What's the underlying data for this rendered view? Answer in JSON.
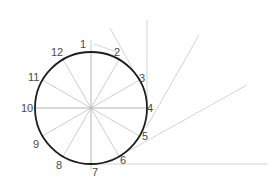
{
  "diagram": {
    "colors": {
      "circle": "#1e1e1e",
      "spokes": "#c8c8c8",
      "construction": "#cfcfcf",
      "labels": "#4a4a4a",
      "background": "#ffffff"
    },
    "circle": {
      "cx": 91,
      "cy": 108,
      "r": 56
    },
    "points": [
      {
        "label": "1",
        "x": 91,
        "y": 52,
        "lx": 80,
        "ly": 48
      },
      {
        "label": "2",
        "x": 119,
        "y": 59.5,
        "lx": 114,
        "ly": 56
      },
      {
        "label": "3",
        "x": 139.5,
        "y": 80,
        "lx": 139,
        "ly": 82
      },
      {
        "label": "4",
        "x": 147,
        "y": 108,
        "lx": 147,
        "ly": 112
      },
      {
        "label": "5",
        "x": 139.5,
        "y": 136,
        "lx": 142,
        "ly": 140
      },
      {
        "label": "6",
        "x": 119,
        "y": 156.5,
        "lx": 120,
        "ly": 164
      },
      {
        "label": "7",
        "x": 91,
        "y": 164,
        "lx": 92,
        "ly": 176
      },
      {
        "label": "8",
        "x": 63,
        "y": 156.5,
        "lx": 56,
        "ly": 169
      },
      {
        "label": "9",
        "x": 42.5,
        "y": 136,
        "lx": 33,
        "ly": 148
      },
      {
        "label": "10",
        "x": 35,
        "y": 108,
        "lx": 21,
        "ly": 112
      },
      {
        "label": "11",
        "x": 42.5,
        "y": 80,
        "lx": 28,
        "ly": 81
      },
      {
        "label": "12",
        "x": 63,
        "y": 59.5,
        "lx": 51,
        "ly": 56
      }
    ],
    "construction_lines": [
      {
        "x1": 94,
        "y1": 44,
        "x2": 117,
        "y2": 52
      },
      {
        "x1": 110,
        "y1": 28,
        "x2": 141,
        "y2": 84
      },
      {
        "x1": 147,
        "y1": 20,
        "x2": 147,
        "y2": 114
      },
      {
        "x1": 199,
        "y1": 35,
        "x2": 146,
        "y2": 128
      },
      {
        "x1": 247,
        "y1": 85,
        "x2": 125,
        "y2": 153
      },
      {
        "x1": 92,
        "y1": 164,
        "x2": 268,
        "y2": 164
      }
    ],
    "axis_lines": [
      {
        "x1": 91,
        "y1": 40,
        "x2": 91,
        "y2": 170
      },
      {
        "x1": 27,
        "y1": 108,
        "x2": 150,
        "y2": 108
      }
    ]
  }
}
